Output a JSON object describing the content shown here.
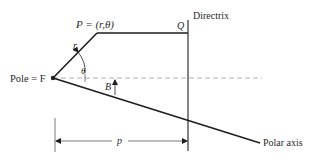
{
  "diagram": {
    "title_labels": {
      "point_p": "P = (r,θ)",
      "point_q": "Q",
      "directrix": "Directrix",
      "pole": "Pole = F",
      "radius": "r",
      "angle_theta": "θ",
      "angle_b": "B",
      "distance_p": "p",
      "polar_axis": "Polar axis"
    },
    "colors": {
      "line": "#1e1e1e",
      "dashed": "#9a9a9a",
      "text": "#2a2a2a",
      "background": "#ffffff"
    }
  }
}
